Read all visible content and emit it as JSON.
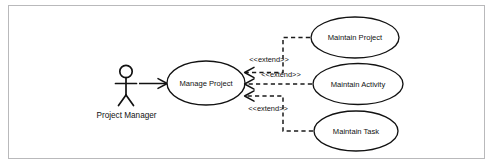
{
  "diagram": {
    "kind": "uml-use-case-diagram",
    "frame": {
      "border_color": "#b9b9bb",
      "background": "#ffffff"
    },
    "stroke_color": "#121212",
    "text_color": "#111111",
    "actors": [
      {
        "id": "project-manager",
        "label": "Project Manager"
      }
    ],
    "use_cases": [
      {
        "id": "manage-project",
        "label": "Manage Project"
      },
      {
        "id": "maintain-project",
        "label": "Maintain Project"
      },
      {
        "id": "maintain-activity",
        "label": "Maintain Activity"
      },
      {
        "id": "maintain-task",
        "label": "Maintain Task"
      }
    ],
    "relationships": [
      {
        "id": "assoc-pm-manage-project",
        "type": "association",
        "from": "project-manager",
        "to": "manage-project",
        "label": ""
      },
      {
        "id": "extend-maintain-project",
        "type": "extend",
        "from": "maintain-project",
        "to": "manage-project",
        "label": "<<extend>>"
      },
      {
        "id": "extend-maintain-activity",
        "type": "extend",
        "from": "maintain-activity",
        "to": "manage-project",
        "label": "<<extend>>"
      },
      {
        "id": "extend-maintain-task",
        "type": "extend",
        "from": "maintain-task",
        "to": "manage-project",
        "label": "<<extend>>"
      }
    ]
  }
}
